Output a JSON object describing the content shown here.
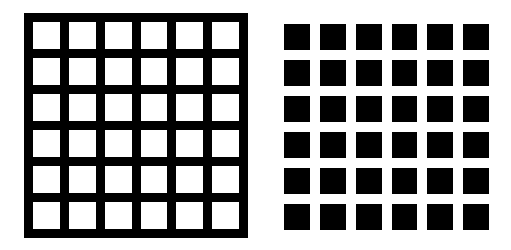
{
  "figure": {
    "panels": [
      {
        "id": "left",
        "description": "black grid with white squares",
        "rows": 6,
        "cols": 6,
        "background_color": "#000000",
        "cell_color": "#ffffff"
      },
      {
        "id": "right",
        "description": "white background with black squares",
        "rows": 6,
        "cols": 6,
        "background_color": "#ffffff",
        "cell_color": "#000000"
      }
    ]
  }
}
